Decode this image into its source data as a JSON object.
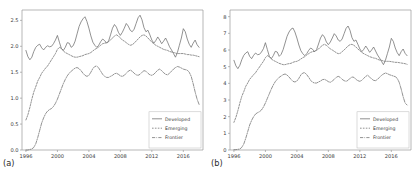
{
  "figure": {
    "background": "#ffffff",
    "line_color": "#6e6e6e",
    "axis_color": "#9a9a9a",
    "panels": [
      "(a)",
      "(b)"
    ]
  },
  "panel_a": {
    "label": "(a)",
    "legend": {
      "items": [
        {
          "label": "Developed",
          "style": "solid"
        },
        {
          "label": "Emerging",
          "style": "dotted"
        },
        {
          "label": "Frontier",
          "style": "dashdot"
        }
      ]
    }
  },
  "panel_b": {
    "label": "(b)",
    "legend": {
      "items": [
        {
          "label": "Developed",
          "style": "solid"
        },
        {
          "label": "Emerging",
          "style": "dotted"
        },
        {
          "label": "Frontier",
          "style": "dashdot"
        }
      ]
    }
  },
  "chart_data": [
    {
      "type": "line",
      "panel": "(a)",
      "title": "",
      "xlabel": "",
      "ylabel": "",
      "xlim": [
        1995.5,
        2018.5
      ],
      "ylim": [
        0.0,
        2.7
      ],
      "grid": false,
      "legend_position": "lower right",
      "xticks": [
        1996,
        2000,
        2004,
        2008,
        2012,
        2016
      ],
      "xticklabels": [
        "1996",
        "2000",
        "2004",
        "2008",
        "2012",
        "2016"
      ],
      "yticks": [
        0.0,
        0.5,
        1.0,
        1.5,
        2.0,
        2.5
      ],
      "yticklabels": [
        "0.0",
        "0.5",
        "1.0",
        "1.5",
        "2.0",
        "2.5"
      ],
      "x": [
        1996.0,
        1996.25,
        1996.5,
        1996.75,
        1997.0,
        1997.25,
        1997.5,
        1997.75,
        1998.0,
        1998.25,
        1998.5,
        1998.75,
        1999.0,
        1999.25,
        1999.5,
        1999.75,
        2000.0,
        2000.25,
        2000.5,
        2000.75,
        2001.0,
        2001.25,
        2001.5,
        2001.75,
        2002.0,
        2002.25,
        2002.5,
        2002.75,
        2003.0,
        2003.25,
        2003.5,
        2003.75,
        2004.0,
        2004.25,
        2004.5,
        2004.75,
        2005.0,
        2005.25,
        2005.5,
        2005.75,
        2006.0,
        2006.25,
        2006.5,
        2006.75,
        2007.0,
        2007.25,
        2007.5,
        2007.75,
        2008.0,
        2008.25,
        2008.5,
        2008.75,
        2009.0,
        2009.25,
        2009.5,
        2009.75,
        2010.0,
        2010.25,
        2010.5,
        2010.75,
        2011.0,
        2011.25,
        2011.5,
        2011.75,
        2012.0,
        2012.25,
        2012.5,
        2012.75,
        2013.0,
        2013.25,
        2013.5,
        2013.75,
        2014.0,
        2014.25,
        2014.5,
        2014.75,
        2015.0,
        2015.25,
        2015.5,
        2015.75,
        2016.0,
        2016.25,
        2016.5,
        2016.75,
        2017.0,
        2017.25,
        2017.5,
        2017.75,
        2018.0
      ],
      "series": [
        {
          "name": "Developed",
          "style": "solid",
          "values": [
            1.92,
            1.8,
            1.74,
            1.79,
            1.9,
            1.98,
            2.02,
            2.04,
            1.97,
            1.93,
            1.98,
            2.01,
            1.99,
            2.0,
            2.05,
            2.12,
            2.21,
            2.08,
            1.96,
            1.92,
            1.98,
            2.07,
            2.06,
            1.98,
            2.01,
            2.1,
            2.24,
            2.38,
            2.47,
            2.53,
            2.57,
            2.48,
            2.35,
            2.2,
            2.08,
            2.02,
            1.98,
            2.02,
            2.09,
            2.14,
            2.11,
            2.06,
            2.1,
            2.22,
            2.35,
            2.42,
            2.37,
            2.27,
            2.21,
            2.27,
            2.35,
            2.44,
            2.39,
            2.31,
            2.28,
            2.33,
            2.44,
            2.55,
            2.6,
            2.51,
            2.36,
            2.28,
            2.31,
            2.22,
            2.12,
            2.06,
            2.11,
            2.18,
            2.12,
            2.05,
            2.1,
            2.16,
            2.08,
            1.99,
            1.93,
            1.86,
            1.79,
            1.88,
            2.02,
            2.16,
            2.34,
            2.28,
            2.14,
            2.04,
            1.98,
            2.06,
            2.12,
            2.03,
            1.98
          ]
        },
        {
          "name": "Emerging",
          "style": "dotted",
          "values": [
            0.58,
            0.68,
            0.82,
            0.98,
            1.12,
            1.22,
            1.33,
            1.4,
            1.48,
            1.53,
            1.58,
            1.62,
            1.68,
            1.74,
            1.8,
            1.86,
            1.94,
            1.98,
            1.96,
            1.91,
            1.88,
            1.86,
            1.84,
            1.82,
            1.8,
            1.79,
            1.79,
            1.8,
            1.81,
            1.82,
            1.84,
            1.85,
            1.86,
            1.88,
            1.91,
            1.94,
            1.96,
            1.99,
            2.02,
            2.05,
            2.06,
            2.07,
            2.09,
            2.12,
            2.16,
            2.2,
            2.22,
            2.2,
            2.16,
            2.12,
            2.1,
            2.07,
            2.04,
            2.02,
            2.03,
            2.06,
            2.1,
            2.14,
            2.18,
            2.21,
            2.22,
            2.2,
            2.16,
            2.12,
            2.08,
            2.05,
            2.02,
            2.0,
            1.98,
            1.96,
            1.94,
            1.93,
            1.92,
            1.9,
            1.89,
            1.88,
            1.87,
            1.86,
            1.86,
            1.86,
            1.86,
            1.85,
            1.84,
            1.84,
            1.83,
            1.83,
            1.82,
            1.81,
            1.8
          ]
        },
        {
          "name": "Frontier",
          "style": "dashdot",
          "values": [
            0.0,
            0.0,
            0.01,
            0.02,
            0.05,
            0.12,
            0.24,
            0.38,
            0.52,
            0.62,
            0.7,
            0.75,
            0.78,
            0.8,
            0.84,
            0.9,
            0.98,
            1.08,
            1.18,
            1.28,
            1.36,
            1.43,
            1.48,
            1.52,
            1.55,
            1.58,
            1.59,
            1.57,
            1.53,
            1.48,
            1.44,
            1.42,
            1.44,
            1.5,
            1.57,
            1.61,
            1.62,
            1.58,
            1.52,
            1.46,
            1.42,
            1.4,
            1.4,
            1.42,
            1.44,
            1.47,
            1.48,
            1.46,
            1.43,
            1.42,
            1.44,
            1.48,
            1.52,
            1.54,
            1.52,
            1.48,
            1.45,
            1.44,
            1.46,
            1.5,
            1.53,
            1.52,
            1.48,
            1.45,
            1.44,
            1.46,
            1.5,
            1.54,
            1.56,
            1.53,
            1.49,
            1.46,
            1.45,
            1.48,
            1.52,
            1.56,
            1.59,
            1.61,
            1.6,
            1.58,
            1.56,
            1.55,
            1.54,
            1.5,
            1.42,
            1.28,
            1.12,
            0.98,
            0.88
          ]
        }
      ]
    },
    {
      "type": "line",
      "panel": "(b)",
      "title": "",
      "xlabel": "",
      "ylabel": "",
      "xlim": [
        1995.5,
        2018.5
      ],
      "ylim": [
        0,
        8.4
      ],
      "grid": false,
      "legend_position": "lower right",
      "xticks": [
        1996,
        2000,
        2004,
        2008,
        2012,
        2016
      ],
      "xticklabels": [
        "1996",
        "2000",
        "2004",
        "2008",
        "2012",
        "2016"
      ],
      "yticks": [
        0,
        1,
        2,
        3,
        4,
        5,
        6,
        7,
        8
      ],
      "yticklabels": [
        "0",
        "1",
        "2",
        "3",
        "4",
        "5",
        "6",
        "7",
        "8"
      ],
      "x": [
        1996.0,
        1996.25,
        1996.5,
        1996.75,
        1997.0,
        1997.25,
        1997.5,
        1997.75,
        1998.0,
        1998.25,
        1998.5,
        1998.75,
        1999.0,
        1999.25,
        1999.5,
        1999.75,
        2000.0,
        2000.25,
        2000.5,
        2000.75,
        2001.0,
        2001.25,
        2001.5,
        2001.75,
        2002.0,
        2002.25,
        2002.5,
        2002.75,
        2003.0,
        2003.25,
        2003.5,
        2003.75,
        2004.0,
        2004.25,
        2004.5,
        2004.75,
        2005.0,
        2005.25,
        2005.5,
        2005.75,
        2006.0,
        2006.25,
        2006.5,
        2006.75,
        2007.0,
        2007.25,
        2007.5,
        2007.75,
        2008.0,
        2008.25,
        2008.5,
        2008.75,
        2009.0,
        2009.25,
        2009.5,
        2009.75,
        2010.0,
        2010.25,
        2010.5,
        2010.75,
        2011.0,
        2011.25,
        2011.5,
        2011.75,
        2012.0,
        2012.25,
        2012.5,
        2012.75,
        2013.0,
        2013.25,
        2013.5,
        2013.75,
        2014.0,
        2014.25,
        2014.5,
        2014.75,
        2015.0,
        2015.25,
        2015.5,
        2015.75,
        2016.0,
        2016.25,
        2016.5,
        2016.75,
        2017.0,
        2017.25,
        2017.5,
        2017.75,
        2018.0
      ],
      "series": [
        {
          "name": "Developed",
          "style": "solid",
          "values": [
            5.38,
            5.05,
            4.88,
            5.08,
            5.42,
            5.68,
            5.82,
            5.9,
            5.62,
            5.48,
            5.68,
            5.82,
            5.72,
            5.74,
            5.88,
            6.08,
            6.44,
            6.02,
            5.62,
            5.48,
            5.66,
            5.92,
            5.88,
            5.62,
            5.74,
            6.02,
            6.42,
            6.82,
            7.08,
            7.25,
            7.32,
            7.08,
            6.72,
            6.3,
            5.96,
            5.78,
            5.66,
            5.78,
            5.98,
            6.12,
            6.04,
            5.9,
            6.02,
            6.36,
            6.72,
            6.92,
            6.78,
            6.48,
            6.32,
            6.48,
            6.72,
            6.98,
            6.84,
            6.6,
            6.52,
            6.66,
            6.98,
            7.3,
            7.44,
            7.18,
            6.74,
            6.52,
            6.6,
            6.34,
            6.06,
            5.9,
            6.04,
            6.24,
            6.06,
            5.86,
            6.0,
            6.18,
            5.94,
            5.7,
            5.52,
            5.32,
            5.12,
            5.38,
            5.78,
            6.18,
            6.7,
            6.52,
            6.12,
            5.84,
            5.66,
            5.9,
            6.06,
            5.8,
            5.66
          ]
        },
        {
          "name": "Emerging",
          "style": "dotted",
          "values": [
            1.66,
            1.96,
            2.36,
            2.82,
            3.22,
            3.5,
            3.82,
            4.02,
            4.24,
            4.38,
            4.52,
            4.64,
            4.82,
            4.98,
            5.16,
            5.32,
            5.54,
            5.66,
            5.6,
            5.46,
            5.38,
            5.32,
            5.26,
            5.2,
            5.16,
            5.12,
            5.12,
            5.16,
            5.18,
            5.2,
            5.26,
            5.3,
            5.32,
            5.38,
            5.46,
            5.54,
            5.6,
            5.7,
            5.78,
            5.86,
            5.9,
            5.92,
            5.98,
            6.06,
            6.18,
            6.28,
            6.34,
            6.28,
            6.18,
            6.06,
            6.0,
            5.92,
            5.84,
            5.78,
            5.8,
            5.9,
            6.0,
            6.12,
            6.24,
            6.32,
            6.34,
            6.28,
            6.18,
            6.06,
            5.96,
            5.86,
            5.78,
            5.72,
            5.66,
            5.6,
            5.56,
            5.52,
            5.5,
            5.44,
            5.4,
            5.38,
            5.34,
            5.32,
            5.32,
            5.32,
            5.3,
            5.28,
            5.26,
            5.26,
            5.24,
            5.22,
            5.2,
            5.18,
            5.14
          ]
        },
        {
          "name": "Frontier",
          "style": "dashdot",
          "values": [
            0.02,
            0.02,
            0.04,
            0.06,
            0.16,
            0.36,
            0.7,
            1.1,
            1.5,
            1.78,
            2.0,
            2.16,
            2.24,
            2.3,
            2.4,
            2.58,
            2.82,
            3.1,
            3.38,
            3.66,
            3.9,
            4.1,
            4.24,
            4.36,
            4.44,
            4.52,
            4.56,
            4.5,
            4.38,
            4.24,
            4.12,
            4.08,
            4.14,
            4.3,
            4.5,
            4.62,
            4.64,
            4.52,
            4.36,
            4.18,
            4.06,
            4.02,
            4.02,
            4.08,
            4.14,
            4.22,
            4.24,
            4.18,
            4.1,
            4.06,
            4.14,
            4.24,
            4.36,
            4.42,
            4.36,
            4.24,
            4.16,
            4.12,
            4.18,
            4.3,
            4.38,
            4.36,
            4.24,
            4.16,
            4.12,
            4.18,
            4.3,
            4.42,
            4.48,
            4.38,
            4.26,
            4.18,
            4.16,
            4.24,
            4.36,
            4.48,
            4.56,
            4.62,
            4.58,
            4.52,
            4.48,
            4.44,
            4.4,
            4.3,
            4.06,
            3.66,
            3.2,
            2.82,
            2.7
          ]
        }
      ]
    }
  ]
}
